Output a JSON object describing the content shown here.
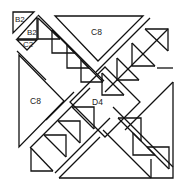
{
  "diagram": {
    "type": "quilt-block-layout",
    "stroke_color": "#111111",
    "background": "#ffffff",
    "labels": {
      "b2_top": "B2",
      "b2_second": "B2",
      "c2": "C2",
      "c8_top": "C8",
      "c8_left": "C8",
      "d4": "D4"
    },
    "pieces": [
      {
        "id": "B2",
        "count": 2,
        "shape": "small triangle"
      },
      {
        "id": "C2",
        "count": 1,
        "shape": "small triangle"
      },
      {
        "id": "C8",
        "count": 2,
        "shape": "large triangle"
      },
      {
        "id": "D4",
        "count": 1,
        "shape": "center square"
      },
      {
        "id": "half-square-triangle-units",
        "shape": "square with diagonal",
        "bands": 2
      }
    ]
  }
}
